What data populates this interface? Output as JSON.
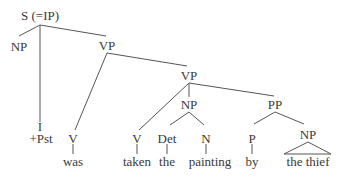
{
  "diagram": {
    "type": "syntax-tree",
    "nodes": {
      "root": "S (=IP)",
      "subject_np": "NP",
      "infl": "I",
      "infl_feature": "+Pst",
      "vp_outer": "VP",
      "v_aux": "V",
      "word_was": "was",
      "vp_inner": "VP",
      "v_main": "V",
      "word_taken": "taken",
      "object_np": "NP",
      "det": "Det",
      "word_the": "the",
      "noun": "N",
      "word_painting": "painting",
      "pp": "PP",
      "prep": "P",
      "word_by": "by",
      "pp_np": "NP",
      "phrase_the_thief": "the thief"
    },
    "colors": {
      "text": "#3a3a3a",
      "lines": "#555555",
      "background": "#ffffff"
    }
  }
}
